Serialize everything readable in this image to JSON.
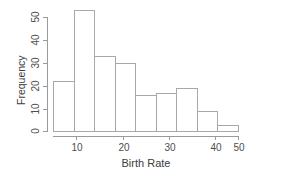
{
  "chart_data": {
    "type": "bar",
    "title": "",
    "subtitle": "",
    "xlabel": "Birth Rate",
    "ylabel": "Frequency",
    "categories": [
      "5-10",
      "10-15",
      "15-20",
      "20-25",
      "25-30",
      "30-35",
      "35-40",
      "40-45",
      "45-50"
    ],
    "bin_edges": [
      5,
      10,
      15,
      20,
      25,
      30,
      35,
      40,
      45,
      50
    ],
    "values": [
      22,
      53,
      33,
      30,
      16,
      17,
      19,
      9,
      3
    ],
    "xlim": [
      5,
      50
    ],
    "ylim": [
      0,
      53
    ],
    "xticks": [
      10,
      20,
      30,
      40,
      50
    ],
    "yticks": [
      0,
      10,
      20,
      30,
      40,
      50
    ],
    "xtick_labels": [
      "10",
      "20",
      "30",
      "40",
      "50"
    ],
    "ytick_labels": [
      "0",
      "10",
      "20",
      "30",
      "40",
      "50"
    ],
    "grid": false,
    "legend": null,
    "bar_fill": "#ffffff",
    "bar_stroke": "#a8a8a8",
    "axis_color": "#9a9a9a",
    "text_color": "#3d3d3d"
  }
}
